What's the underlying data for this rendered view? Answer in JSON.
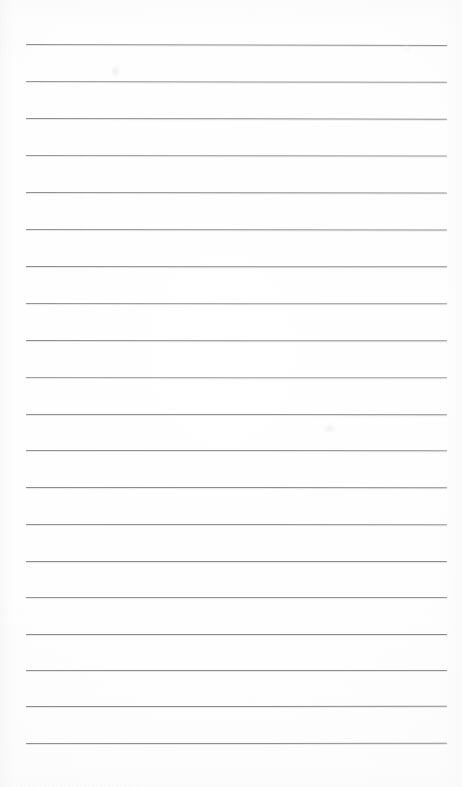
{
  "document": {
    "kind": "scanned-blank-ruled-notebook-page",
    "orientation": "portrait",
    "page_width_px": 462,
    "page_height_px": 787,
    "background_color": "#fefefe",
    "visible_text": "",
    "text_content_note": "",
    "title": "",
    "header": "",
    "footer": "",
    "page_number": ""
  },
  "ruling": {
    "line_color": "#8a8a8a",
    "line_color_light": "#a6a6a6",
    "line_thickness_px": 1,
    "line_count": 20,
    "left_x_px": 26,
    "right_x_px": 447,
    "first_line_y_px": 44,
    "line_spacing_px": 36.8,
    "margin_rule_present": false,
    "lines": [
      {
        "index": 1,
        "y": 44.0,
        "x1": 26,
        "x2": 447,
        "tilt_deg": 0.12,
        "color": "#8c8c8c",
        "opacity": 0.95
      },
      {
        "index": 2,
        "y": 81.0,
        "x1": 26,
        "x2": 447,
        "tilt_deg": 0.1,
        "color": "#8f8f8f",
        "opacity": 0.93
      },
      {
        "index": 3,
        "y": 118.0,
        "x1": 26,
        "x2": 447,
        "tilt_deg": 0.09,
        "color": "#8a8a8a",
        "opacity": 0.95
      },
      {
        "index": 4,
        "y": 155.0,
        "x1": 26,
        "x2": 447,
        "tilt_deg": 0.08,
        "color": "#909090",
        "opacity": 0.92
      },
      {
        "index": 5,
        "y": 192.0,
        "x1": 26,
        "x2": 447,
        "tilt_deg": 0.07,
        "color": "#8b8b8b",
        "opacity": 0.94
      },
      {
        "index": 6,
        "y": 229.0,
        "x1": 26,
        "x2": 447,
        "tilt_deg": 0.06,
        "color": "#8d8d8d",
        "opacity": 0.94
      },
      {
        "index": 7,
        "y": 266.0,
        "x1": 26,
        "x2": 447,
        "tilt_deg": 0.05,
        "color": "#898989",
        "opacity": 0.96
      },
      {
        "index": 8,
        "y": 303.0,
        "x1": 26,
        "x2": 447,
        "tilt_deg": 0.05,
        "color": "#8e8e8e",
        "opacity": 0.93
      },
      {
        "index": 9,
        "y": 340.0,
        "x1": 26,
        "x2": 447,
        "tilt_deg": 0.04,
        "color": "#8a8a8a",
        "opacity": 0.95
      },
      {
        "index": 10,
        "y": 377.0,
        "x1": 26,
        "x2": 447,
        "tilt_deg": 0.04,
        "color": "#949494",
        "opacity": 0.9
      },
      {
        "index": 11,
        "y": 414.0,
        "x1": 26,
        "x2": 447,
        "tilt_deg": 0.03,
        "color": "#8b8b8b",
        "opacity": 0.94
      },
      {
        "index": 12,
        "y": 450.0,
        "x1": 26,
        "x2": 447,
        "tilt_deg": 0.03,
        "color": "#8d8d8d",
        "opacity": 0.94
      },
      {
        "index": 13,
        "y": 487.0,
        "x1": 26,
        "x2": 447,
        "tilt_deg": 0.02,
        "color": "#888888",
        "opacity": 0.96
      },
      {
        "index": 14,
        "y": 524.0,
        "x1": 26,
        "x2": 447,
        "tilt_deg": 0.02,
        "color": "#8c8c8c",
        "opacity": 0.94
      },
      {
        "index": 15,
        "y": 561.0,
        "x1": 26,
        "x2": 447,
        "tilt_deg": 0.01,
        "color": "#8a8a8a",
        "opacity": 0.95
      },
      {
        "index": 16,
        "y": 597.0,
        "x1": 26,
        "x2": 447,
        "tilt_deg": 0.01,
        "color": "#8f8f8f",
        "opacity": 0.92
      },
      {
        "index": 17,
        "y": 634.0,
        "x1": 26,
        "x2": 447,
        "tilt_deg": 0.0,
        "color": "#878787",
        "opacity": 0.96
      },
      {
        "index": 18,
        "y": 670.0,
        "x1": 26,
        "x2": 447,
        "tilt_deg": 0.0,
        "color": "#8b8b8b",
        "opacity": 0.95
      },
      {
        "index": 19,
        "y": 706.0,
        "x1": 26,
        "x2": 447,
        "tilt_deg": -0.02,
        "color": "#898989",
        "opacity": 0.96
      },
      {
        "index": 20,
        "y": 743.0,
        "x1": 26,
        "x2": 447,
        "tilt_deg": -0.03,
        "color": "#8a8a8a",
        "opacity": 0.95
      }
    ]
  },
  "artifacts": {
    "smudges": [
      {
        "name": "faint-mark-upper-left",
        "x": 112,
        "y": 67,
        "w": 7,
        "h": 9,
        "color": "#f2f2f2",
        "opacity": 0.85
      },
      {
        "name": "faint-mark-mid-right",
        "x": 325,
        "y": 425,
        "w": 9,
        "h": 7,
        "color": "#f3f3f3",
        "opacity": 0.8
      },
      {
        "name": "faint-mark-upper-right",
        "x": 404,
        "y": 46,
        "w": 6,
        "h": 5,
        "color": "#f5f5f5",
        "opacity": 0.7
      }
    ]
  }
}
